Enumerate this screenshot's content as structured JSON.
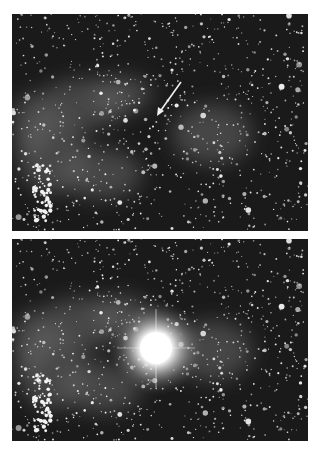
{
  "figure": {
    "panels": [
      {
        "id": "before",
        "description": "star field with faint nebulosity; arrow points to progenitor star",
        "has_arrow": true
      },
      {
        "id": "after",
        "description": "same star field with a bright point source (supernova) near center",
        "has_flare": true
      }
    ],
    "colors": {
      "background": "#ffffff",
      "sky": "#1a1a1a",
      "star": "#f2f2f2",
      "nebula": "#6a6a6a"
    }
  }
}
